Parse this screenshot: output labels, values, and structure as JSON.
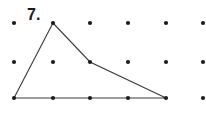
{
  "figure": {
    "label": "7.",
    "background_color": "#ffffff",
    "dot_color": "#1c1c1c",
    "line_color": "#3a3a3a",
    "dot_radius": 2.1,
    "line_width": 1.1,
    "width": 206,
    "height": 113
  },
  "chart_data": {
    "type": "scatter",
    "title": "7.",
    "xlabel": "",
    "ylabel": "",
    "grid": false,
    "xlim": [
      0,
      206
    ],
    "ylim": [
      0,
      113
    ],
    "grid_dots": {
      "columns_x": [
        14,
        53,
        90,
        128,
        166,
        203
      ],
      "rows_y": [
        23,
        62,
        98
      ],
      "count": 18,
      "points": [
        {
          "x": 14,
          "y": 23
        },
        {
          "x": 53,
          "y": 23
        },
        {
          "x": 90,
          "y": 23
        },
        {
          "x": 128,
          "y": 23
        },
        {
          "x": 166,
          "y": 23
        },
        {
          "x": 203,
          "y": 23
        },
        {
          "x": 14,
          "y": 62
        },
        {
          "x": 53,
          "y": 62
        },
        {
          "x": 90,
          "y": 62
        },
        {
          "x": 128,
          "y": 62
        },
        {
          "x": 166,
          "y": 62
        },
        {
          "x": 203,
          "y": 62
        },
        {
          "x": 14,
          "y": 98
        },
        {
          "x": 53,
          "y": 98
        },
        {
          "x": 90,
          "y": 98
        },
        {
          "x": 128,
          "y": 98
        },
        {
          "x": 166,
          "y": 98
        },
        {
          "x": 203,
          "y": 98
        }
      ]
    },
    "polygon": {
      "closed": true,
      "vertices": [
        {
          "x": 14,
          "y": 98,
          "name": "bottom-left"
        },
        {
          "x": 53,
          "y": 23,
          "name": "apex"
        },
        {
          "x": 90,
          "y": 62,
          "name": "mid-bend"
        },
        {
          "x": 166,
          "y": 98,
          "name": "bottom-right"
        }
      ],
      "points_attr": "14,98 53,23 90,62 166,98"
    }
  }
}
